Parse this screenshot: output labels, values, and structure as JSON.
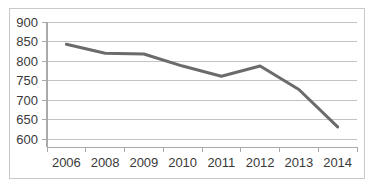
{
  "chart_data": {
    "type": "line",
    "title": "",
    "subtitle": "",
    "xlabel": "",
    "ylabel": "",
    "categories": [
      "2006",
      "2008",
      "2009",
      "2010",
      "2011",
      "2012",
      "2013",
      "2014"
    ],
    "values": [
      843,
      820,
      818,
      787,
      761,
      787,
      727,
      631
    ],
    "series": [
      {
        "name": "",
        "values": [
          843,
          820,
          818,
          787,
          761,
          787,
          727,
          631
        ]
      }
    ],
    "ylim": [
      600,
      900
    ],
    "yticks": [
      600,
      650,
      700,
      750,
      800,
      850,
      900
    ],
    "ytick_labels": [
      "600",
      "650",
      "700",
      "750",
      "800",
      "850",
      "900"
    ],
    "xtick_labels": [
      "2006",
      "2008",
      "2009",
      "2010",
      "2011",
      "2012",
      "2013",
      "2014"
    ],
    "grid": true,
    "grid_axis": "y",
    "legend": false,
    "legend_position": "none",
    "markers": false,
    "annotations": []
  },
  "style": {
    "line_color": "#6b6b6b",
    "grid_color": "#c3c3c3",
    "axis_color": "#aaaaaa",
    "border_color": "#c9c9c9",
    "text_color": "#3a3a3a",
    "background": "#ffffff",
    "line_width": 3
  }
}
